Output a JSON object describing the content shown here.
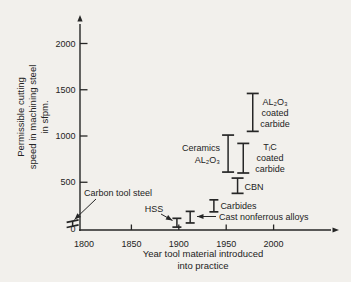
{
  "figure": {
    "background": "#f2f0ec",
    "ink": "#262626"
  },
  "chart_data": {
    "type": "bar",
    "subtype": "vertical-range-intervals",
    "title": "",
    "xlabel_lines": [
      "Year tool material introduced",
      "into practice"
    ],
    "ylabel_lines": [
      "Permissible cutting",
      "speed in machining steel",
      "in sfpm."
    ],
    "ylabel": "Permissible cutting speed in machining steel in sfpm.",
    "xlabel": "Year tool material introduced into practice",
    "x_ticks": [
      1800,
      1850,
      1900,
      1950,
      2000
    ],
    "y_ticks": [
      0,
      500,
      1000,
      1500,
      2000
    ],
    "xlim": [
      1785,
      2065
    ],
    "ylim": [
      0,
      2200
    ],
    "grid": false,
    "legend": "none",
    "series": [
      {
        "id": "carbon-tool-steel",
        "label": "Carbon tool steel",
        "year": 1788,
        "speed_low": 25,
        "speed_high": 80
      },
      {
        "id": "hss",
        "label": "HSS",
        "year": 1898,
        "speed_low": 15,
        "speed_high": 110
      },
      {
        "id": "cast-nonferrous",
        "label": "Cast nonferrous alloys",
        "year": 1912,
        "speed_low": 60,
        "speed_high": 185
      },
      {
        "id": "carbides",
        "label": "Carbides",
        "year": 1937,
        "speed_low": 180,
        "speed_high": 310
      },
      {
        "id": "ceramics",
        "label": "Ceramics AL₂O₃",
        "label_lines": [
          "Ceramics",
          "AL₂O₃"
        ],
        "year": 1952,
        "speed_low": 610,
        "speed_high": 1010
      },
      {
        "id": "cbn",
        "label": "CBN",
        "year": 1962,
        "speed_low": 380,
        "speed_high": 545
      },
      {
        "id": "tic-coated-carbide",
        "label": "TᵢC coated carbide",
        "label_lines": [
          "TᵢC",
          "coated",
          "carbide"
        ],
        "year": 1968,
        "speed_low": 600,
        "speed_high": 920
      },
      {
        "id": "al2o3-coated-carbide",
        "label": "AL₂O₃ coated carbide",
        "label_lines": [
          "AL₂O₃",
          "coated",
          "carbide"
        ],
        "year": 1978,
        "speed_low": 1050,
        "speed_high": 1460
      }
    ]
  }
}
